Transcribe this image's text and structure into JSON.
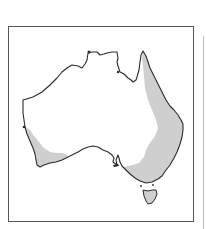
{
  "map": {
    "region": "Australia",
    "type": "distribution-map",
    "legend": null,
    "colors": {
      "background": "#ffffff",
      "land": "#ffffff",
      "coastline": "#2a2a2a",
      "distribution_fill": "#cfcfcf",
      "frame": "#555555"
    },
    "shaded_regions": [
      {
        "name": "eastern-distribution",
        "description": "Eastern Queensland, New South Wales, Victoria and eastern South Australia"
      },
      {
        "name": "southwestern-distribution",
        "description": "South-west Western Australia"
      },
      {
        "name": "tasmania-distribution",
        "description": "Tasmania"
      }
    ]
  }
}
